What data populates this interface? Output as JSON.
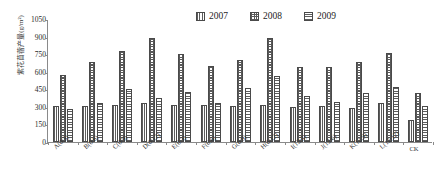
{
  "chart_data": {
    "type": "bar",
    "title": "",
    "xlabel": "",
    "ylabel": "紫花苜蓿产量(g/m²)",
    "ylim": [
      0,
      1050
    ],
    "yticks": [
      0,
      150,
      300,
      450,
      600,
      750,
      900,
      1050
    ],
    "ytick_labels": [
      "0",
      "150",
      "300",
      "450",
      "600",
      "750",
      "900",
      "1050"
    ],
    "grid": false,
    "legend_position": "top-right",
    "categories": [
      "A(0:3)",
      "B(0:6)",
      "C(0:9)",
      "D(0:12)",
      "E(6:3)",
      "F(6:6)",
      "G(6:9)",
      "H(6:12)",
      "I(12:3)",
      "J(12:6)",
      "K(12:9)",
      "L(12:12)",
      "CK"
    ],
    "series": [
      {
        "name": "2007",
        "pattern": "vertical-lines",
        "values": [
          310,
          310,
          320,
          330,
          315,
          315,
          310,
          320,
          300,
          305,
          290,
          330,
          190
        ]
      },
      {
        "name": "2008",
        "pattern": "checkered",
        "values": [
          570,
          680,
          775,
          890,
          750,
          645,
          700,
          890,
          640,
          640,
          680,
          760,
          420
        ]
      },
      {
        "name": "2009",
        "pattern": "horizontal-lines",
        "values": [
          285,
          330,
          455,
          380,
          425,
          335,
          460,
          565,
          390,
          345,
          420,
          470,
          310
        ]
      }
    ]
  },
  "legend": {
    "items": [
      {
        "label": "2007"
      },
      {
        "label": "2008"
      },
      {
        "label": "2009"
      }
    ]
  },
  "colors": {
    "axis": "#8a8a8a",
    "bar_edge": "#4a4a4a",
    "hatch": "#5d5d5d",
    "text": "#2b2b2b",
    "background": "#ffffff"
  }
}
